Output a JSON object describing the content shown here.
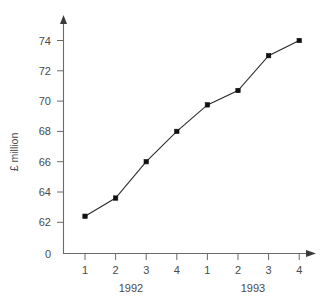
{
  "chart_data": {
    "type": "line",
    "title": "",
    "xlabel": "",
    "ylabel": "£ million",
    "categories": [
      "1",
      "2",
      "3",
      "4",
      "1",
      "2",
      "3",
      "4"
    ],
    "values": [
      62.4,
      63.6,
      66.0,
      68.0,
      69.75,
      70.7,
      73.0,
      74.0
    ],
    "series": [
      {
        "name": "£ million",
        "values": [
          62.4,
          63.6,
          66.0,
          68.0,
          69.75,
          70.7,
          73.0,
          74.0
        ]
      }
    ],
    "groups": [
      {
        "label": "1992",
        "quarters": [
          "1",
          "2",
          "3",
          "4"
        ]
      },
      {
        "label": "1993",
        "quarters": [
          "1",
          "2",
          "3",
          "4"
        ]
      }
    ],
    "y_ticks": [
      "0",
      "62",
      "64",
      "66",
      "68",
      "70",
      "72",
      "74"
    ],
    "y_tick_values": [
      0,
      62,
      64,
      66,
      68,
      70,
      72,
      74
    ],
    "x_ticks": [
      "1",
      "2",
      "3",
      "4",
      "1",
      "2",
      "3",
      "4"
    ],
    "ylim": [
      62,
      74
    ],
    "xlim": [
      0,
      9
    ],
    "axis_break": true,
    "grid": false,
    "legend": "none",
    "marker": "square",
    "colors": {
      "line": "#2b2b2b",
      "marker": "#111111",
      "axis": "#6a6a6a",
      "text": "#4a4a4a",
      "background": "#ffffff"
    }
  },
  "axes": {
    "y_title": "£ million",
    "origin_label": "0"
  }
}
